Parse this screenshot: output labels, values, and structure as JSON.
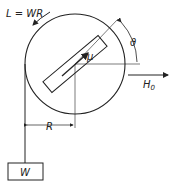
{
  "diagram": {
    "type": "physics-mechanics",
    "labels": {
      "torque": "L = WR",
      "moment": "μ",
      "angle": "ϑ",
      "field": "H",
      "field_sub": "0",
      "radius": "R",
      "weight": "W"
    },
    "colors": {
      "stroke": "#222222",
      "background": "#ffffff"
    }
  }
}
